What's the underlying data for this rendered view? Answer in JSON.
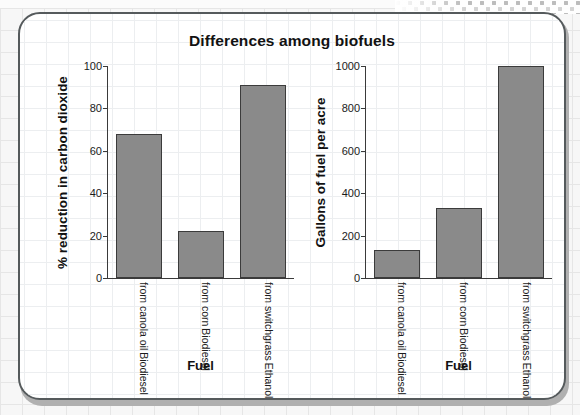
{
  "chart_data": [
    {
      "type": "bar",
      "panel": "left",
      "title": "Differences among biofuels",
      "xlabel": "Fuel",
      "ylabel": "% reduction in carbon dioxide",
      "categories": [
        [
          "Biodiesel",
          "from canola oil"
        ],
        [
          "Biodiesel",
          "from corn"
        ],
        [
          "Ethanol",
          "from switchgrass"
        ]
      ],
      "values": [
        68,
        22,
        91
      ],
      "ylim": [
        0,
        100
      ],
      "yticks": [
        0,
        20,
        40,
        60,
        80,
        100
      ],
      "grid": false,
      "legend": "none",
      "bar_color": "#8a8a8a",
      "bar_edge_color": "#3b3b3b"
    },
    {
      "type": "bar",
      "panel": "right",
      "title": "Differences among biofuels",
      "xlabel": "Fuel",
      "ylabel": "Gallons of fuel per acre",
      "categories": [
        [
          "Biodiesel",
          "from canola oil"
        ],
        [
          "Biodiesel",
          "from corn"
        ],
        [
          "Ethanol",
          "from switchgrass"
        ]
      ],
      "values": [
        130,
        330,
        1000
      ],
      "ylim": [
        0,
        1000
      ],
      "yticks": [
        0,
        200,
        400,
        600,
        800,
        1000
      ],
      "grid": false,
      "legend": "none",
      "bar_color": "#8a8a8a",
      "bar_edge_color": "#3b3b3b"
    }
  ],
  "figure": {
    "title": "Differences among biofuels"
  }
}
